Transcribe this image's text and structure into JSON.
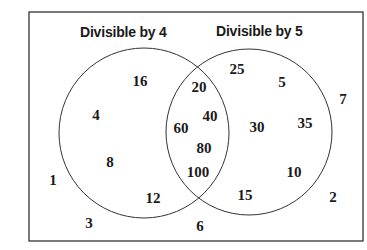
{
  "title_left": "Divisible by 4",
  "title_right": "Divisible by 5",
  "sets": {
    "only_4": [
      "16",
      "4",
      "8",
      "12"
    ],
    "both": [
      "20",
      "40",
      "60",
      "80",
      "100"
    ],
    "only_5": [
      "25",
      "5",
      "30",
      "35",
      "10",
      "15"
    ],
    "neither": [
      "1",
      "3",
      "6",
      "2",
      "7"
    ]
  },
  "colors": {
    "stroke": "#333333",
    "text": "#1a1a1a",
    "background": "#ffffff"
  }
}
